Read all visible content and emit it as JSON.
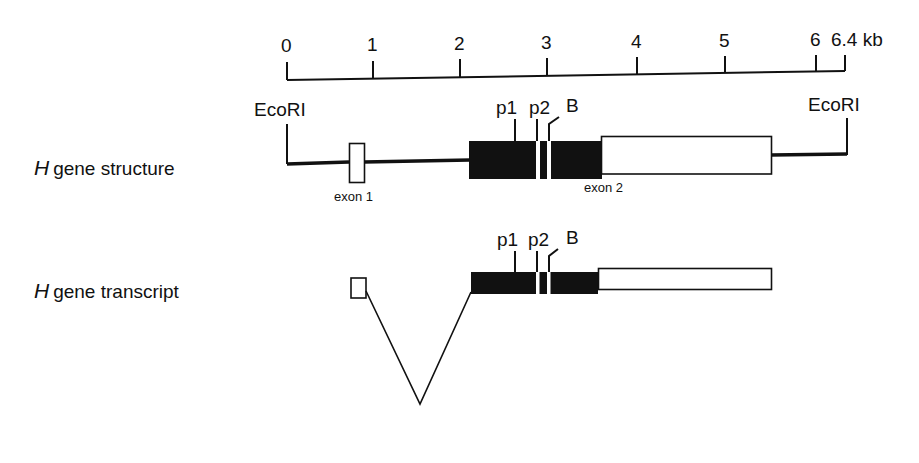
{
  "scale_bar": {
    "unit": "kb",
    "ticks": [
      {
        "label": "0",
        "x": 287
      },
      {
        "label": "1",
        "x": 373
      },
      {
        "label": "2",
        "x": 460
      },
      {
        "label": "3",
        "x": 547
      },
      {
        "label": "4",
        "x": 637
      },
      {
        "label": "5",
        "x": 725
      },
      {
        "label": "6",
        "x": 816
      },
      {
        "label": "6.4",
        "x": 845
      }
    ],
    "end_label": "6.4 kb"
  },
  "gene_structure": {
    "row_label_italic": "H",
    "row_label_rest": "gene structure",
    "left_site": "EcoRI",
    "right_site": "EcoRI",
    "exon1_label": "exon 1",
    "exon2_label": "exon 2",
    "markers": [
      "p1",
      "p2",
      "B"
    ]
  },
  "gene_transcript": {
    "row_label_italic": "H",
    "row_label_rest": "gene transcript",
    "markers": [
      "p1",
      "p2",
      "B"
    ]
  },
  "colors": {
    "ink": "#111111",
    "background": "#ffffff"
  }
}
